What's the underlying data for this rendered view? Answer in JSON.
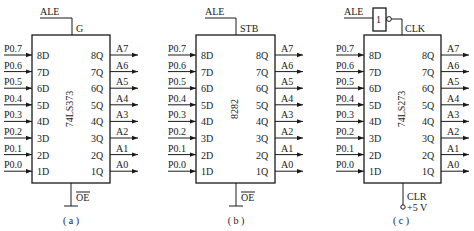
{
  "diagram": {
    "input_pins": [
      "8D",
      "7D",
      "6D",
      "5D",
      "4D",
      "3D",
      "2D",
      "1D"
    ],
    "output_pins": [
      "8Q",
      "7Q",
      "6Q",
      "5Q",
      "4Q",
      "3Q",
      "2Q",
      "1Q"
    ],
    "input_signals": [
      "P0.7",
      "P0.6",
      "P0.5",
      "P0.4",
      "P0.3",
      "P0.2",
      "P0.1",
      "P0.0"
    ],
    "output_signals": [
      "A7",
      "A6",
      "A5",
      "A4",
      "A3",
      "A2",
      "A1",
      "A0"
    ],
    "chips": [
      {
        "id": "a",
        "name": "74LS373",
        "control_input": "ALE",
        "control_pin": "G",
        "bottom_pin": "OE",
        "bottom_pin_overline": true,
        "bottom_connection": "ground",
        "caption": "( a )"
      },
      {
        "id": "b",
        "name": "8282",
        "control_input": "ALE",
        "control_pin": "STB",
        "bottom_pin": "OE",
        "bottom_pin_overline": true,
        "bottom_connection": "ground",
        "caption": "( b )"
      },
      {
        "id": "c",
        "name": "74LS273",
        "control_input": "ALE",
        "control_pin": "CLK",
        "inverter_label": "1",
        "bottom_pin": "CLR",
        "bottom_pin_overline": false,
        "bottom_connection": "+5 V",
        "caption": "( c )"
      }
    ]
  }
}
